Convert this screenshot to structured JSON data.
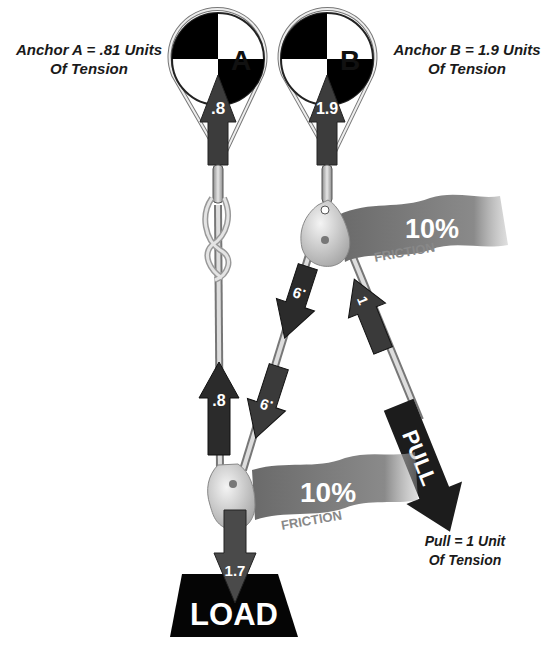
{
  "anchors": [
    {
      "id": "A",
      "letter": "A",
      "force": ".8",
      "caption_line1": "Anchor A = .81 Units",
      "caption_line2": "Of Tension"
    },
    {
      "id": "B",
      "letter": "B",
      "force": "1.9",
      "caption_line1": "Anchor B = 1.9 Units",
      "caption_line2": "Of Tension"
    }
  ],
  "pulleys": [
    {
      "id": "top",
      "friction_percent": "10%",
      "friction_label": "FRICTION"
    },
    {
      "id": "bottom",
      "friction_percent": "10%",
      "friction_label": "FRICTION"
    }
  ],
  "force_arrows": {
    "left_strand": ".8",
    "middle_upper": ".9",
    "middle_lower": ".9",
    "pull_strand": "1",
    "load": "1.7",
    "pull_arrow_label": "PULL"
  },
  "load": {
    "label": "LOAD"
  },
  "pull_caption": {
    "line1": "Pull = 1 Unit",
    "line2": "Of Tension"
  },
  "colors": {
    "arrow_dark": "#2b2b2b",
    "arrow_mid": "#4a4a4a",
    "flag": "#7a7a7a",
    "rope": "#c8c8c8",
    "pulley": "#d9d9d9",
    "black": "#000000"
  }
}
